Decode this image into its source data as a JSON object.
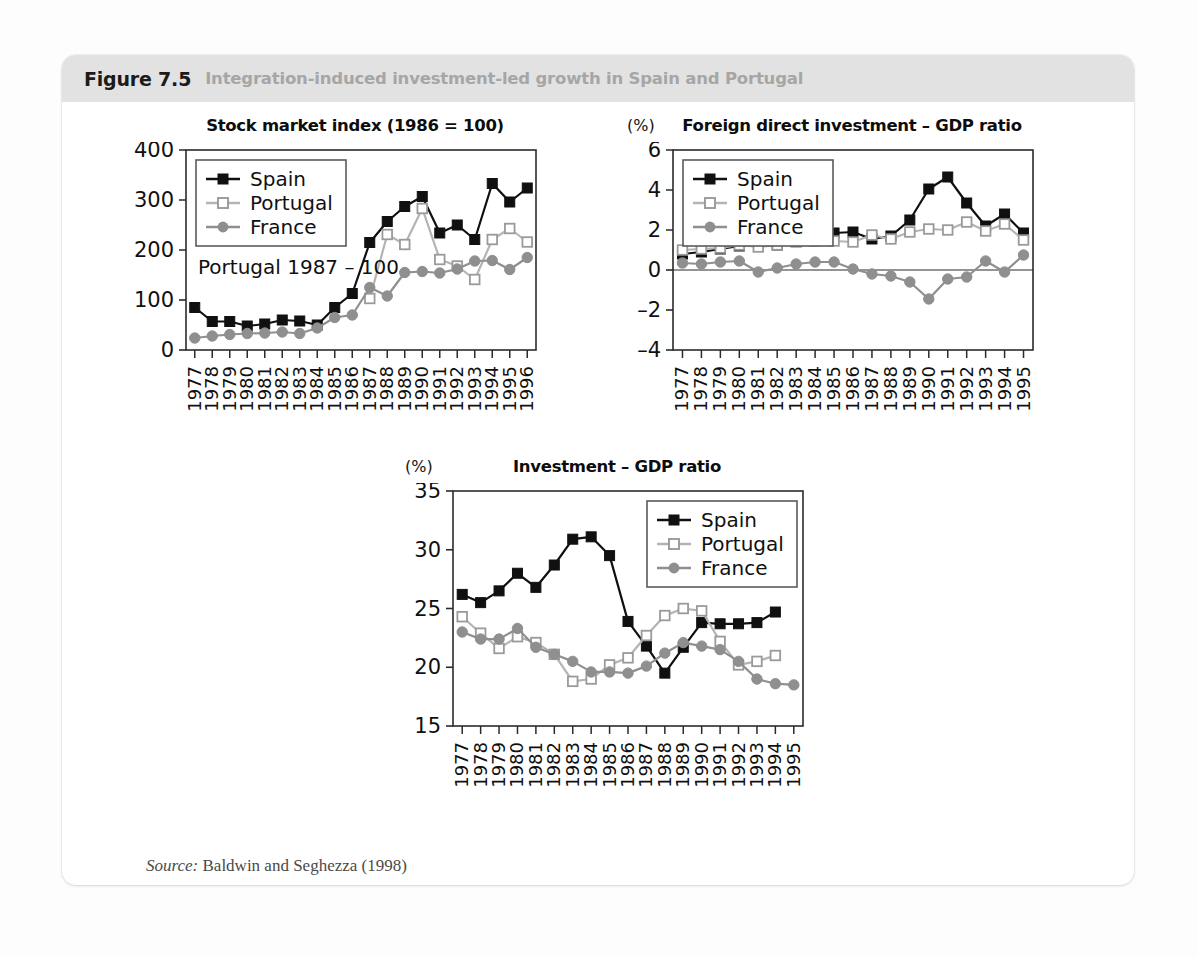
{
  "figure": {
    "number": "Figure 7.5",
    "caption": "Integration-induced investment-led growth in Spain and Portugal",
    "source_label": "Source:",
    "source_text": "Baldwin and Seghezza (1998)",
    "header_bg": "#e2e2e2"
  },
  "series_colors": {
    "spain": "#101010",
    "portugal": "#c9c9c9",
    "france": "#8f8f8f"
  },
  "legend": {
    "spain": "Spain",
    "portugal": "Portugal",
    "france": "France"
  },
  "chart_data": [
    {
      "id": "stock",
      "type": "line",
      "title": "Stock market index (1986 = 100)",
      "unit": "",
      "annotation": "Portugal 1987 – 100",
      "xlabel": "",
      "ylabel": "",
      "grid": false,
      "legend_position": "top-left",
      "ylim": [
        0,
        400
      ],
      "yticks": [
        0,
        100,
        200,
        300,
        400
      ],
      "categories": [
        "1977",
        "1978",
        "1979",
        "1980",
        "1981",
        "1982",
        "1983",
        "1984",
        "1985",
        "1986",
        "1987",
        "1988",
        "1989",
        "1990",
        "1991",
        "1992",
        "1993",
        "1994",
        "1995",
        "1996"
      ],
      "series": [
        {
          "name": "Spain",
          "key": "spain",
          "values": [
            85,
            57,
            57,
            48,
            52,
            60,
            58,
            50,
            85,
            113,
            215,
            257,
            287,
            307,
            234,
            250,
            221,
            333,
            296,
            324
          ]
        },
        {
          "name": "Portugal",
          "key": "portugal",
          "values": [
            null,
            null,
            null,
            null,
            null,
            null,
            null,
            null,
            null,
            null,
            103,
            231,
            211,
            283,
            181,
            168,
            141,
            221,
            243,
            216
          ]
        },
        {
          "name": "France",
          "key": "france",
          "values": [
            24,
            28,
            31,
            33,
            34,
            36,
            33,
            44,
            65,
            70,
            125,
            108,
            155,
            157,
            154,
            162,
            178,
            179,
            161,
            185
          ]
        }
      ]
    },
    {
      "id": "fdi",
      "type": "line",
      "title": "Foreign direct investment – GDP ratio",
      "unit": "(%)",
      "annotation": "",
      "xlabel": "",
      "ylabel": "",
      "grid": false,
      "legend_position": "top-left",
      "ylim": [
        -4,
        6
      ],
      "yticks": [
        -4,
        -2,
        0,
        2,
        4,
        6
      ],
      "zero_line": 0,
      "categories": [
        "1977",
        "1978",
        "1979",
        "1980",
        "1981",
        "1982",
        "1983",
        "1984",
        "1985",
        "1986",
        "1987",
        "1988",
        "1989",
        "1990",
        "1991",
        "1992",
        "1993",
        "1994",
        "1995"
      ],
      "series": [
        {
          "name": "Spain",
          "key": "spain",
          "values": [
            0.8,
            0.9,
            1.05,
            1.2,
            1.45,
            1.25,
            1.5,
            1.75,
            1.85,
            1.9,
            1.55,
            1.7,
            2.5,
            4.05,
            4.65,
            3.35,
            2.2,
            2.8,
            1.85,
            1.65
          ]
        },
        {
          "name": "Portugal",
          "key": "portugal",
          "values": [
            1.0,
            1.05,
            1.1,
            1.25,
            1.15,
            1.25,
            1.4,
            1.45,
            1.45,
            1.4,
            1.75,
            1.55,
            1.9,
            2.05,
            2.0,
            2.4,
            1.95,
            2.3,
            1.5,
            1.6
          ]
        },
        {
          "name": "France",
          "key": "france",
          "values": [
            0.35,
            0.3,
            0.4,
            0.45,
            -0.1,
            0.1,
            0.3,
            0.4,
            0.4,
            0.05,
            -0.2,
            -0.3,
            -0.6,
            -1.45,
            -0.45,
            -0.35,
            0.45,
            -0.1,
            0.75
          ]
        }
      ]
    },
    {
      "id": "investment",
      "type": "line",
      "title": "Investment – GDP ratio",
      "unit": "(%)",
      "annotation": "",
      "xlabel": "",
      "ylabel": "",
      "grid": false,
      "legend_position": "top-right",
      "ylim": [
        15,
        35
      ],
      "yticks": [
        15,
        20,
        25,
        30,
        35
      ],
      "categories": [
        "1977",
        "1978",
        "1979",
        "1980",
        "1981",
        "1982",
        "1983",
        "1984",
        "1985",
        "1986",
        "1987",
        "1988",
        "1989",
        "1990",
        "1991",
        "1992",
        "1993",
        "1994",
        "1995"
      ],
      "series": [
        {
          "name": "Spain",
          "key": "spain",
          "values": [
            26.2,
            25.5,
            26.5,
            28.0,
            26.8,
            28.7,
            30.9,
            31.1,
            29.5,
            23.9,
            21.8,
            19.5,
            21.7,
            23.8,
            23.7,
            23.7,
            23.8,
            24.7,
            null
          ]
        },
        {
          "name": "Portugal",
          "key": "portugal",
          "values": [
            24.3,
            22.9,
            21.6,
            22.6,
            22.1,
            21.1,
            18.8,
            19.0,
            20.2,
            20.8,
            22.7,
            24.4,
            25.0,
            24.8,
            22.2,
            20.2,
            20.5,
            21.0,
            null
          ]
        },
        {
          "name": "France",
          "key": "france",
          "values": [
            23.0,
            22.4,
            22.4,
            23.3,
            21.7,
            21.1,
            20.5,
            19.6,
            19.6,
            19.5,
            20.1,
            21.2,
            22.1,
            21.8,
            21.5,
            20.5,
            19.0,
            18.6,
            18.5
          ]
        }
      ]
    }
  ]
}
